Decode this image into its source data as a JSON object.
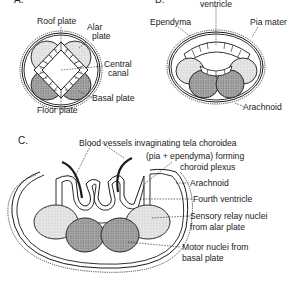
{
  "figure": {
    "panels": [
      {
        "id": "A",
        "label": "A.",
        "annotations": {
          "roof_plate": "Roof plate",
          "alar_plate_1": "Alar",
          "alar_plate_2": "plate",
          "central_canal_1": "Central",
          "central_canal_2": "canal",
          "basal_plate": "Basal plate",
          "floor_plate": "Floor plate"
        }
      },
      {
        "id": "B",
        "label": "B.",
        "annotations": {
          "fourth_ventricle": "ventricle",
          "ependyma": "Ependyma",
          "pia_mater": "Pia mater",
          "arachnoid": "Arachnoid"
        }
      },
      {
        "id": "C",
        "label": "C.",
        "annotations": {
          "blood_vessels": "Blood vessels invaginating tela choroidea",
          "pia_ependyma": "(pia + ependyma) forming",
          "choroid_plexus": "choroid plexus",
          "arachnoid": "Arachnoid",
          "fourth_ventricle": "Fourth ventricle",
          "sensory_1": "Sensory relay nuclei",
          "sensory_2": "from alar plate",
          "motor_1": "Motor nuclei from",
          "motor_2": "basal plate"
        }
      }
    ],
    "colors": {
      "line": "#1a1a1a",
      "alar_fill": "#e4e4e4",
      "basal_fill": "#a9a9a9",
      "background": "#ffffff"
    }
  }
}
